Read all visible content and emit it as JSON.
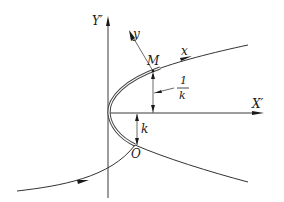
{
  "diagram": {
    "type": "geometry-figure",
    "labels": {
      "Y_axis": "Y′",
      "X_axis": "X′",
      "y_axis": "y",
      "x_axis": "x",
      "point_M": "M",
      "point_O": "O",
      "curvature": "k",
      "radius_numerator": "1",
      "radius_denominator": "k"
    }
  }
}
